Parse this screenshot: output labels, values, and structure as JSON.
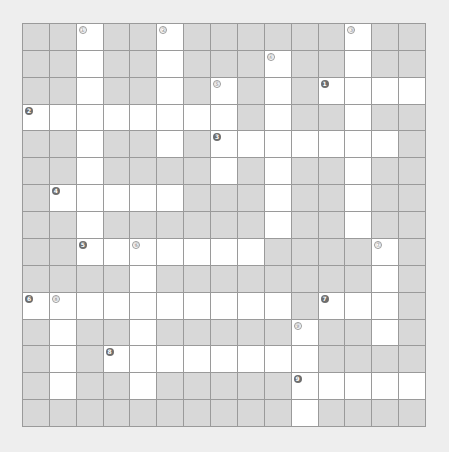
{
  "puzzle": {
    "rows": 15,
    "cols": 15,
    "colors": {
      "page_background": "#eeeeee",
      "blocked_cell": "#d8d8d8",
      "open_cell": "#ffffff",
      "grid_line": "#9a9a9a",
      "across_marker": "#6e6e6e",
      "down_marker_outline": "#9a9a9a"
    },
    "open_cells_by_row": [
      [
        2,
        5,
        12
      ],
      [
        2,
        5,
        9,
        12
      ],
      [
        2,
        5,
        7,
        9,
        11,
        12,
        13,
        14
      ],
      [
        0,
        1,
        2,
        3,
        4,
        5,
        6,
        7,
        9,
        12
      ],
      [
        2,
        5,
        7,
        8,
        9,
        10,
        11,
        12,
        13
      ],
      [
        2,
        7,
        9,
        12
      ],
      [
        1,
        2,
        3,
        4,
        5,
        9,
        12
      ],
      [
        2,
        9,
        12
      ],
      [
        2,
        3,
        4,
        5,
        6,
        7,
        8,
        13
      ],
      [
        4,
        13
      ],
      [
        0,
        1,
        2,
        3,
        4,
        5,
        6,
        7,
        8,
        9,
        11,
        12,
        13
      ],
      [
        1,
        4,
        10,
        13
      ],
      [
        1,
        3,
        4,
        5,
        6,
        7,
        8,
        9,
        10
      ],
      [
        1,
        4,
        10,
        11,
        12,
        13,
        14
      ],
      [
        10
      ]
    ],
    "down_markers": [
      {
        "label": "①",
        "row": 0,
        "col": 2
      },
      {
        "label": "②",
        "row": 0,
        "col": 5
      },
      {
        "label": "③",
        "row": 0,
        "col": 12
      },
      {
        "label": "④",
        "row": 1,
        "col": 9
      },
      {
        "label": "⑤",
        "row": 2,
        "col": 7
      },
      {
        "label": "⑥",
        "row": 8,
        "col": 4
      },
      {
        "label": "⑦",
        "row": 8,
        "col": 13
      },
      {
        "label": "⑧",
        "row": 10,
        "col": 1
      },
      {
        "label": "⑨",
        "row": 11,
        "col": 10
      }
    ],
    "across_markers": [
      {
        "label": "1",
        "row": 2,
        "col": 11
      },
      {
        "label": "2",
        "row": 3,
        "col": 0
      },
      {
        "label": "3",
        "row": 4,
        "col": 7
      },
      {
        "label": "4",
        "row": 6,
        "col": 1
      },
      {
        "label": "5",
        "row": 8,
        "col": 2
      },
      {
        "label": "6",
        "row": 10,
        "col": 0
      },
      {
        "label": "7",
        "row": 10,
        "col": 11
      },
      {
        "label": "8",
        "row": 12,
        "col": 3
      },
      {
        "label": "9",
        "row": 13,
        "col": 10
      }
    ]
  }
}
